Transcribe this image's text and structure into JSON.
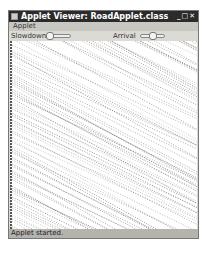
{
  "window": {
    "title": "Applet Viewer: RoadApplet.class",
    "controls": "_ □ ✕"
  },
  "menubar": {
    "items": [
      {
        "label": "Applet"
      }
    ]
  },
  "controls": {
    "slowdown_label": "Slowdown",
    "arrival_label": "Arrival"
  },
  "status": {
    "text": "Applet started."
  },
  "colors": {
    "titlebar": "#2b2b2b",
    "window_bg": "#dcdad5",
    "status_bg": "#b5b3ae",
    "line": "#333333"
  }
}
